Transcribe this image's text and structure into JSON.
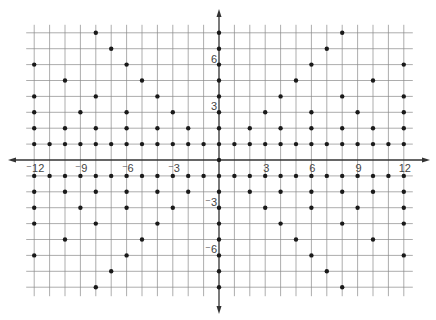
{
  "chart_data": {
    "type": "scatter",
    "title": "",
    "xlabel": "",
    "ylabel": "",
    "xlim": [
      -12,
      12
    ],
    "ylim": [
      -8,
      8
    ],
    "grid": true,
    "legend": null,
    "x_tick_labels": [
      {
        "value": -12,
        "label": "⁻12"
      },
      {
        "value": -9,
        "label": "⁻9"
      },
      {
        "value": -6,
        "label": "⁻6"
      },
      {
        "value": -3,
        "label": "⁻3"
      },
      {
        "value": 3,
        "label": "3"
      },
      {
        "value": 6,
        "label": "6"
      },
      {
        "value": 9,
        "label": "9"
      },
      {
        "value": 12,
        "label": "12"
      }
    ],
    "y_tick_labels": [
      {
        "value": 6,
        "label": "6"
      },
      {
        "value": 3,
        "label": "3"
      },
      {
        "value": -3,
        "label": "⁻3"
      },
      {
        "value": -6,
        "label": "⁻6"
      }
    ],
    "points": [
      [
        -8,
        8
      ],
      [
        0,
        8
      ],
      [
        8,
        8
      ],
      [
        -7,
        7
      ],
      [
        0,
        7
      ],
      [
        7,
        7
      ],
      [
        -12,
        6
      ],
      [
        -6,
        6
      ],
      [
        0,
        6
      ],
      [
        6,
        6
      ],
      [
        12,
        6
      ],
      [
        -10,
        5
      ],
      [
        -5,
        5
      ],
      [
        0,
        5
      ],
      [
        5,
        5
      ],
      [
        10,
        5
      ],
      [
        -12,
        4
      ],
      [
        -8,
        4
      ],
      [
        -4,
        4
      ],
      [
        0,
        4
      ],
      [
        4,
        4
      ],
      [
        8,
        4
      ],
      [
        12,
        4
      ],
      [
        -12,
        3
      ],
      [
        -9,
        3
      ],
      [
        -6,
        3
      ],
      [
        -3,
        3
      ],
      [
        0,
        3
      ],
      [
        3,
        3
      ],
      [
        6,
        3
      ],
      [
        9,
        3
      ],
      [
        12,
        3
      ],
      [
        -12,
        2
      ],
      [
        -10,
        2
      ],
      [
        -8,
        2
      ],
      [
        -6,
        2
      ],
      [
        -4,
        2
      ],
      [
        -2,
        2
      ],
      [
        0,
        2
      ],
      [
        2,
        2
      ],
      [
        4,
        2
      ],
      [
        6,
        2
      ],
      [
        8,
        2
      ],
      [
        10,
        2
      ],
      [
        12,
        2
      ],
      [
        -12,
        1
      ],
      [
        -11,
        1
      ],
      [
        -10,
        1
      ],
      [
        -9,
        1
      ],
      [
        -8,
        1
      ],
      [
        -7,
        1
      ],
      [
        -6,
        1
      ],
      [
        -5,
        1
      ],
      [
        -4,
        1
      ],
      [
        -3,
        1
      ],
      [
        -2,
        1
      ],
      [
        -1,
        1
      ],
      [
        0,
        1
      ],
      [
        1,
        1
      ],
      [
        2,
        1
      ],
      [
        3,
        1
      ],
      [
        4,
        1
      ],
      [
        5,
        1
      ],
      [
        6,
        1
      ],
      [
        7,
        1
      ],
      [
        8,
        1
      ],
      [
        9,
        1
      ],
      [
        10,
        1
      ],
      [
        11,
        1
      ],
      [
        12,
        1
      ],
      [
        0,
        0
      ],
      [
        -12,
        -1
      ],
      [
        -11,
        -1
      ],
      [
        -10,
        -1
      ],
      [
        -9,
        -1
      ],
      [
        -8,
        -1
      ],
      [
        -7,
        -1
      ],
      [
        -6,
        -1
      ],
      [
        -5,
        -1
      ],
      [
        -4,
        -1
      ],
      [
        -3,
        -1
      ],
      [
        -2,
        -1
      ],
      [
        -1,
        -1
      ],
      [
        0,
        -1
      ],
      [
        1,
        -1
      ],
      [
        2,
        -1
      ],
      [
        3,
        -1
      ],
      [
        4,
        -1
      ],
      [
        5,
        -1
      ],
      [
        6,
        -1
      ],
      [
        7,
        -1
      ],
      [
        8,
        -1
      ],
      [
        9,
        -1
      ],
      [
        10,
        -1
      ],
      [
        11,
        -1
      ],
      [
        12,
        -1
      ],
      [
        -12,
        -2
      ],
      [
        -10,
        -2
      ],
      [
        -8,
        -2
      ],
      [
        -6,
        -2
      ],
      [
        -4,
        -2
      ],
      [
        -2,
        -2
      ],
      [
        0,
        -2
      ],
      [
        2,
        -2
      ],
      [
        4,
        -2
      ],
      [
        6,
        -2
      ],
      [
        8,
        -2
      ],
      [
        10,
        -2
      ],
      [
        12,
        -2
      ],
      [
        -12,
        -3
      ],
      [
        -9,
        -3
      ],
      [
        -6,
        -3
      ],
      [
        -3,
        -3
      ],
      [
        0,
        -3
      ],
      [
        3,
        -3
      ],
      [
        6,
        -3
      ],
      [
        9,
        -3
      ],
      [
        12,
        -3
      ],
      [
        -12,
        -4
      ],
      [
        -8,
        -4
      ],
      [
        -4,
        -4
      ],
      [
        0,
        -4
      ],
      [
        4,
        -4
      ],
      [
        8,
        -4
      ],
      [
        12,
        -4
      ],
      [
        -10,
        -5
      ],
      [
        -5,
        -5
      ],
      [
        0,
        -5
      ],
      [
        5,
        -5
      ],
      [
        10,
        -5
      ],
      [
        -12,
        -6
      ],
      [
        -6,
        -6
      ],
      [
        0,
        -6
      ],
      [
        6,
        -6
      ],
      [
        12,
        -6
      ],
      [
        -7,
        -7
      ],
      [
        0,
        -7
      ],
      [
        7,
        -7
      ],
      [
        -8,
        -8
      ],
      [
        0,
        -8
      ],
      [
        8,
        -8
      ]
    ]
  },
  "colors": {
    "grid": "#8a8a8a",
    "axis": "#333333",
    "point": "#1a1a1a",
    "label": "#444444"
  }
}
